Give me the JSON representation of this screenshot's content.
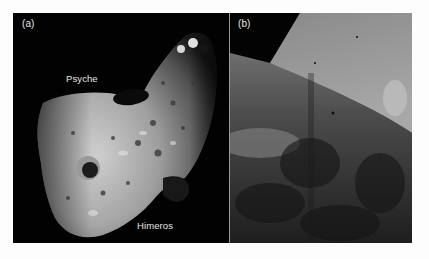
{
  "figure": {
    "panels": [
      {
        "id": "a",
        "label": "(a)",
        "annotations": [
          {
            "text": "Psyche"
          },
          {
            "text": "Himeros"
          }
        ]
      },
      {
        "id": "b",
        "label": "(b)",
        "annotations": []
      }
    ]
  },
  "colors": {
    "page_background": "#fdfdfd",
    "space": "#020202",
    "label_text": "#e6e6e6",
    "divider": "#9a9a9a"
  }
}
